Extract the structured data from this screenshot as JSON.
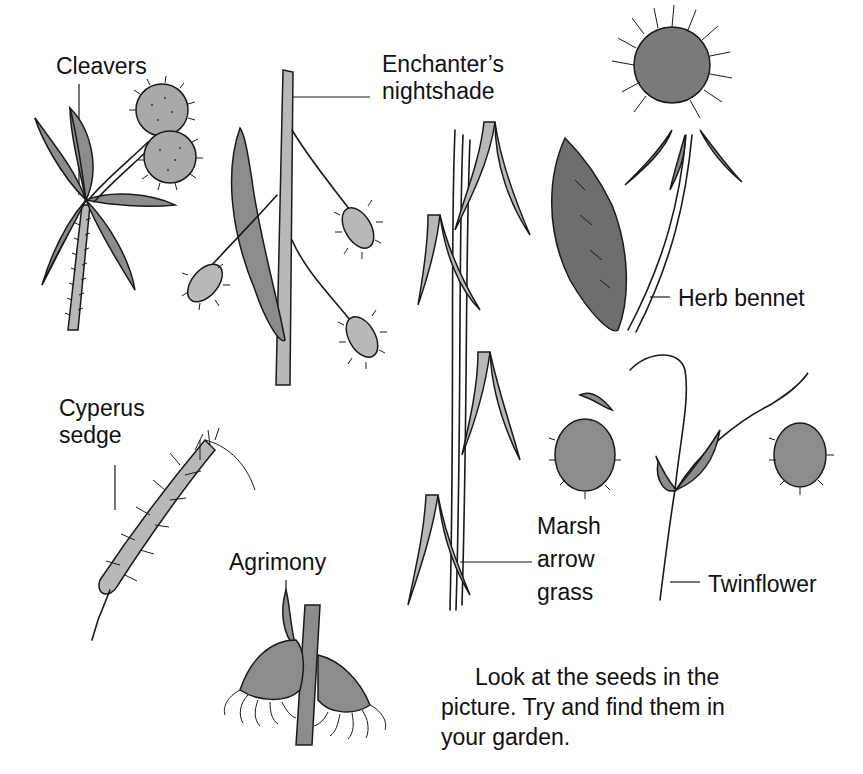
{
  "illustration": {
    "title": "Seeds found in the garden",
    "plants": [
      {
        "id": "cleavers",
        "label": "Cleavers"
      },
      {
        "id": "enchanters-nightshade",
        "label_line1": "Enchanter’s",
        "label_line2": "nightshade"
      },
      {
        "id": "herb-bennet",
        "label": "Herb bennet"
      },
      {
        "id": "cyperus-sedge",
        "label_line1": "Cyperus",
        "label_line2": "sedge"
      },
      {
        "id": "agrimony",
        "label": "Agrimony"
      },
      {
        "id": "marsh-arrow-grass",
        "label_line1": "Marsh",
        "label_line2": "arrow",
        "label_line3": "grass"
      },
      {
        "id": "twinflower",
        "label": "Twinflower"
      }
    ]
  },
  "caption": {
    "line1": "Look at the seeds in the",
    "line2": "picture. Try and find them in",
    "line3": "your garden."
  },
  "colors": {
    "ink": "#1a1a1a",
    "shade_mid": "#8c8c8c",
    "shade_light": "#b8b8b8",
    "shade_dark": "#6e6e6e",
    "background": "#ffffff"
  }
}
